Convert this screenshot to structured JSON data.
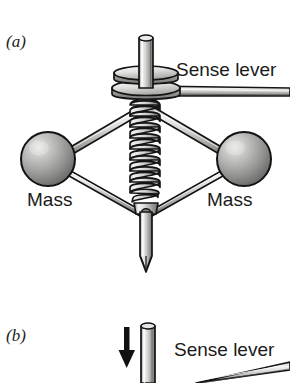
{
  "figure": {
    "type": "technical-illustration",
    "background_color": "#ffffff",
    "panels": [
      {
        "id": "a",
        "label": "(a)",
        "callouts": [
          {
            "name": "sense-lever",
            "text": "Sense lever"
          },
          {
            "name": "mass-left",
            "text": "Mass"
          },
          {
            "name": "mass-right",
            "text": "Mass"
          }
        ],
        "parts": [
          {
            "name": "upper-shaft",
            "kind": "vertical-rod"
          },
          {
            "name": "upper-disc",
            "kind": "ellipse-plate"
          },
          {
            "name": "lower-disc",
            "kind": "ellipse-plate"
          },
          {
            "name": "coil-spring",
            "kind": "helical-spring",
            "turns": 9
          },
          {
            "name": "mass-sphere-left",
            "kind": "sphere"
          },
          {
            "name": "mass-sphere-right",
            "kind": "sphere"
          },
          {
            "name": "linkage-arm-upper-left",
            "kind": "rod"
          },
          {
            "name": "linkage-arm-upper-right",
            "kind": "rod"
          },
          {
            "name": "linkage-arm-lower-left",
            "kind": "rod"
          },
          {
            "name": "linkage-arm-lower-right",
            "kind": "rod"
          },
          {
            "name": "lower-joint",
            "kind": "pivot"
          },
          {
            "name": "lower-shaft",
            "kind": "vertical-rod-pointed"
          },
          {
            "name": "sense-lever-rod",
            "kind": "horizontal-rod"
          }
        ]
      },
      {
        "id": "b",
        "label": "(b)",
        "callouts": [
          {
            "name": "sense-lever",
            "text": "Sense lever"
          }
        ],
        "parts": [
          {
            "name": "motion-arrow-down",
            "kind": "arrow",
            "direction": "down"
          },
          {
            "name": "shaft",
            "kind": "vertical-rod"
          },
          {
            "name": "sense-lever-rod-tilted",
            "kind": "rod"
          }
        ]
      }
    ],
    "colors": {
      "outline": "#111111",
      "metal_light": "#f2f2f0",
      "metal_mid": "#b9b9b6",
      "metal_dark": "#6e6e6c",
      "sphere_light": "#d8d8d6",
      "sphere_mid": "#9a9a98",
      "sphere_dark": "#5a5a58",
      "text": "#1a1a1a"
    }
  }
}
